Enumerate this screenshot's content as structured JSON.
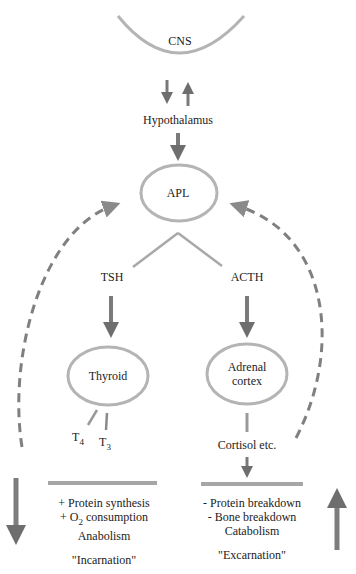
{
  "nodes": {
    "cns": "CNS",
    "hypothalamus": "Hypothalamus",
    "apl": "APL",
    "tsh": "TSH",
    "acth": "ACTH",
    "thyroid": "Thyroid",
    "adrenal_line1": "Adrenal",
    "adrenal_line2": "cortex",
    "t4_base": "T",
    "t4_sub": "4",
    "t3_base": "T",
    "t3_sub": "3",
    "cortisol": "Cortisol etc."
  },
  "left_effects": {
    "line1": "+ Protein synthesis",
    "line2_prefix": "+ O",
    "line2_sub": "2",
    "line2_suffix": " consumption",
    "line3": "Anabolism",
    "label": "\"Incarnation\""
  },
  "right_effects": {
    "line1": "- Protein breakdown",
    "line2": "- Bone breakdown",
    "line3": "Catabolism",
    "label": "\"Excarnation\""
  },
  "colors": {
    "stroke": "#9a9a9a",
    "arrow": "#707070",
    "dashed": "#808080"
  }
}
